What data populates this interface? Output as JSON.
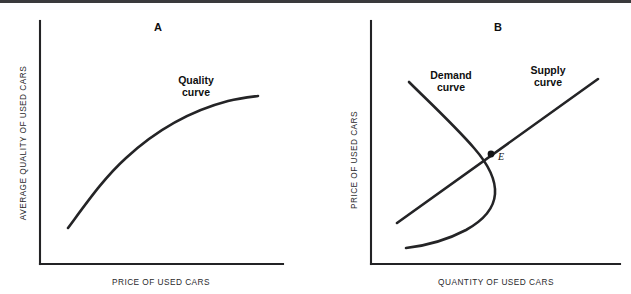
{
  "figure": {
    "width": 631,
    "height": 294,
    "background": "#ffffff",
    "rule_color": "#3a3a3c",
    "ink_color": "#242426"
  },
  "panel_a": {
    "letter": "A",
    "letter_pos": [
      158,
      31
    ],
    "x_axis_title": "PRICE OF USED CARS",
    "y_axis_title": "AVERAGE QUALITY OF USED CARS",
    "axis": {
      "origin": [
        40,
        264
      ],
      "x_end": [
        283,
        264
      ],
      "y_top": [
        40,
        21
      ]
    },
    "curve_label_line1": "Quality",
    "curve_label_line2": "curve",
    "curve_label_pos": [
      196,
      84
    ]
  },
  "panel_b": {
    "letter": "B",
    "letter_pos": [
      182,
      31
    ],
    "x_axis_title": "QUANTITY OF USED CARS",
    "y_axis_title": "PRICE OF USED CARS",
    "axis": {
      "origin": [
        55,
        264
      ],
      "x_end": [
        304,
        264
      ],
      "y_top": [
        55,
        21
      ]
    },
    "demand_label_line1": "Demand",
    "demand_label_line2": "curve",
    "demand_label_pos": [
      135,
      79
    ],
    "supply_label_line1": "Supply",
    "supply_label_line2": "curve",
    "supply_label_pos": [
      232,
      74
    ],
    "equilibrium_label": "E",
    "equilibrium_label_pos": [
      182,
      160
    ],
    "equilibrium_point": [
      175,
      154
    ],
    "equilibrium_dot_radius": 3.4
  },
  "chart_data": {
    "type": "line",
    "panels": [
      {
        "id": "A",
        "label": "A",
        "xlabel": "PRICE OF USED CARS",
        "ylabel": "AVERAGE QUALITY OF USED CARS",
        "grid": false,
        "legend": "inline-annotation",
        "xlim": [
          0,
          100
        ],
        "ylim": [
          0,
          100
        ],
        "series": [
          {
            "name": "Quality curve",
            "shape": "concave-increasing",
            "points": [
              [
                11.5,
                15.0
              ],
              [
                18.0,
                27.5
              ],
              [
                26.0,
                40.0
              ],
              [
                36.0,
                51.0
              ],
              [
                48.0,
                60.5
              ],
              [
                62.0,
                67.5
              ],
              [
                78.0,
                72.5
              ],
              [
                90.0,
                74.5
              ]
            ],
            "path": "M 68 228 C 88 201 104 178 126 158 C 152 134 186 112 228 101 C 240 98 250 97 258 96"
          }
        ]
      },
      {
        "id": "B",
        "label": "B",
        "xlabel": "QUANTITY OF USED CARS",
        "ylabel": "PRICE OF USED CARS",
        "grid": false,
        "legend": "inline-annotation",
        "xlim": [
          0,
          100
        ],
        "ylim": [
          0,
          100
        ],
        "series": [
          {
            "name": "Demand curve",
            "shape": "backward-bending",
            "points": [
              [
                15.0,
                82.0
              ],
              [
                28.0,
                66.0
              ],
              [
                41.0,
                52.0
              ],
              [
                50.0,
                40.0
              ],
              [
                53.5,
                30.0
              ],
              [
                50.0,
                20.0
              ],
              [
                38.0,
                11.0
              ],
              [
                22.0,
                6.5
              ],
              [
                13.5,
                5.5
              ]
            ],
            "path": "M 93 82 C 112 101 138 125 158 148 C 172 164 180 180 179 194 C 178 208 168 220 150 230 C 131 240 108 246 90 248"
          },
          {
            "name": "Supply curve",
            "shape": "linear-increasing",
            "points": [
              [
                23.0,
                16.5
              ],
              [
                50.0,
                41.0
              ],
              [
                76.0,
                74.5
              ]
            ],
            "path": "M 81 223 L 282 79"
          }
        ],
        "annotations": [
          {
            "name": "equilibrium",
            "label": "E",
            "point": [
              50.0,
              44.0
            ],
            "marker": "filled-dot"
          }
        ]
      }
    ]
  }
}
